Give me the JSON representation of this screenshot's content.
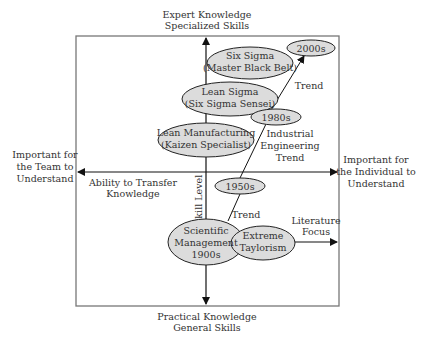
{
  "axes": {
    "top": [
      "Expert Knowledge",
      "Specialized Skills"
    ],
    "bottom": [
      "Practical Knowledge",
      "General Skills"
    ],
    "left": [
      "Important for",
      "the Team to",
      "Understand"
    ],
    "right": [
      "Important for",
      "the Individual to",
      "Understand"
    ],
    "horizontal_axis_label": [
      "Ability to Transfer",
      "Knowledge"
    ],
    "vertical_axis_label": "Skill Level"
  },
  "nodes": {
    "six_sigma": [
      "Six Sigma",
      "(Master Black Belt)"
    ],
    "lean_sigma": [
      "Lean Sigma",
      "(Six Sigma Sensei)"
    ],
    "lean_manufacturing": [
      "Lean Manufacturing",
      "(Kaizen Specialist)"
    ],
    "scientific_management": [
      "Scientific",
      "Management",
      "1900s"
    ],
    "extreme_taylorism": [
      "Extreme",
      "Taylorism"
    ],
    "era_2000s": "2000s",
    "era_1980s": "1980s",
    "era_1950s": "1950s"
  },
  "annotations": {
    "trend_upper": "Trend",
    "industrial_engineering_trend": [
      "Industrial",
      "Engineering",
      "Trend"
    ],
    "trend_lower": "Trend",
    "literature_focus": [
      "Literature",
      "Focus"
    ]
  },
  "colors": {
    "ellipse_fill": "#dcdcdc",
    "stroke": "#222222",
    "box_stroke": "#777777",
    "text": "#333333"
  }
}
